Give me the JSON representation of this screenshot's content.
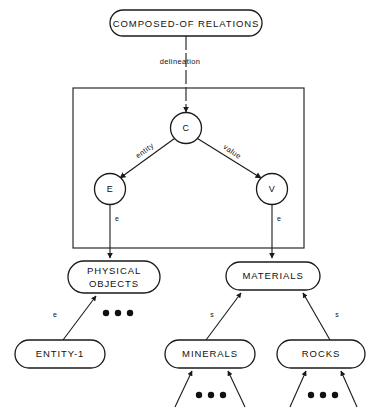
{
  "diagram": {
    "title_node": {
      "label": "COMPOSED-OF  RELATIONS"
    },
    "delineation_edge": {
      "label": "delineation"
    },
    "group_box": {
      "name": "schema-box"
    },
    "circles": [
      {
        "id": "c",
        "label": "C"
      },
      {
        "id": "e",
        "label": "E"
      },
      {
        "id": "v",
        "label": "V"
      }
    ],
    "circle_edges": [
      {
        "from": "C",
        "to": "E",
        "label": "entity"
      },
      {
        "from": "C",
        "to": "V",
        "label": "value"
      }
    ],
    "instance_edges": [
      {
        "id": "e-left",
        "label": "e"
      },
      {
        "id": "e-right",
        "label": "e"
      }
    ],
    "level2_nodes": [
      {
        "id": "physical-objects",
        "line1": "PHYSICAL",
        "line2": "OBJECTS"
      },
      {
        "id": "materials",
        "line1": "MATERIALS",
        "line2": ""
      }
    ],
    "level3_nodes": [
      {
        "id": "entity-1",
        "label": "ENTITY-1"
      },
      {
        "id": "minerals",
        "label": "MINERALS"
      },
      {
        "id": "rocks",
        "label": "ROCKS"
      }
    ],
    "subtype_edges": [
      {
        "id": "entity1-to-physical",
        "label": "e"
      },
      {
        "id": "minerals-to-materials",
        "label": "s"
      },
      {
        "id": "rocks-to-materials",
        "label": "s"
      }
    ],
    "ellipses": [
      {
        "id": "ellipsis-physical"
      },
      {
        "id": "ellipsis-minerals"
      },
      {
        "id": "ellipsis-rocks"
      }
    ],
    "colors": {
      "stroke": "#1a1a1a",
      "background": "#ffffff",
      "box_stroke": "#2b2b2b"
    }
  }
}
